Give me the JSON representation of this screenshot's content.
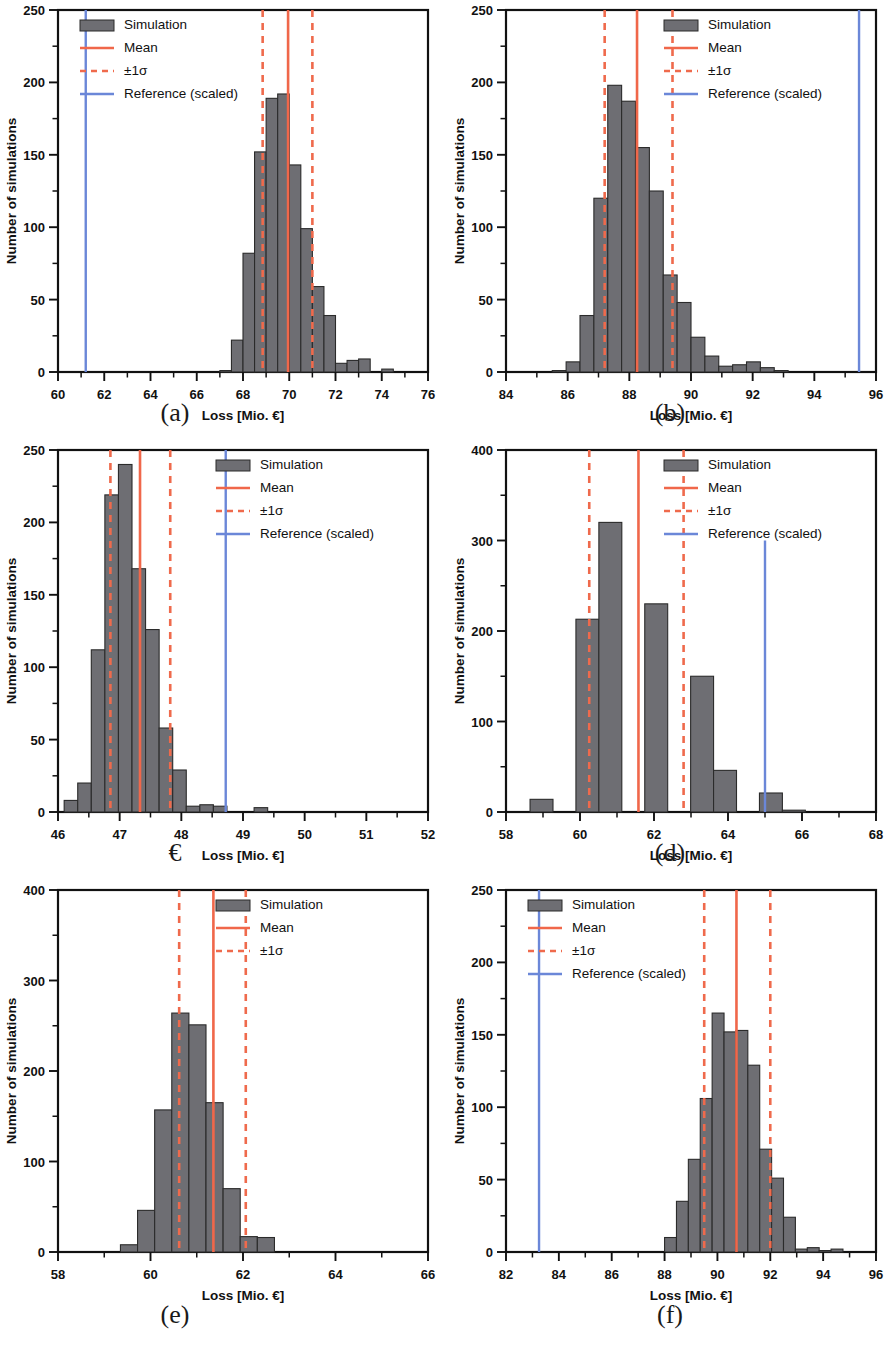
{
  "figure": {
    "axis_label_x": "Loss [Mio. €]",
    "axis_label_y": "Number of simulations",
    "legend": {
      "simulation": "Simulation",
      "mean": "Mean",
      "sigma": "±1σ",
      "reference": "Reference (scaled)"
    },
    "colors": {
      "bar_fill": "#6e6e73",
      "bar_edge": "#2b2b2b",
      "mean": "#f0674a",
      "sigma": "#ef6a4c",
      "reference": "#6b87d8",
      "axis": "#111111"
    },
    "captions": [
      "(a)",
      "(b)",
      "€",
      "(d)",
      "(e)",
      "(f)"
    ]
  },
  "chart_data": [
    {
      "type": "bar",
      "panel": "a",
      "title": "",
      "xlabel": "Loss [Mio. €]",
      "ylabel": "Number of simulations",
      "xlim": [
        60,
        76
      ],
      "ylim": [
        0,
        250
      ],
      "xticks": [
        60,
        62,
        64,
        66,
        68,
        70,
        72,
        74,
        76
      ],
      "yticks": [
        0,
        50,
        100,
        150,
        200,
        250
      ],
      "bin_width": 0.5,
      "bin_edges": [
        67.0,
        67.5,
        68.0,
        68.5,
        69.0,
        69.5,
        70.0,
        70.5,
        71.0,
        71.5,
        72.0,
        72.5,
        73.0,
        73.5,
        74.0,
        74.5,
        75.0
      ],
      "values": [
        1,
        22,
        82,
        152,
        189,
        192,
        143,
        99,
        59,
        39,
        6,
        8,
        9,
        0,
        2,
        0
      ],
      "mean": 69.95,
      "sigma_low": 68.85,
      "sigma_high": 71.0,
      "reference": 61.2,
      "legend_entries": [
        "Simulation",
        "Mean",
        "±1σ",
        "Reference (scaled)"
      ],
      "legend_position": "upper left",
      "grid": false
    },
    {
      "type": "bar",
      "panel": "b",
      "title": "",
      "xlabel": "Loss [Mio. €]",
      "ylabel": "Number of simulations",
      "xlim": [
        84,
        96
      ],
      "ylim": [
        0,
        250
      ],
      "xticks": [
        84,
        86,
        88,
        90,
        92,
        94,
        96
      ],
      "yticks": [
        0,
        50,
        100,
        150,
        200,
        250
      ],
      "bin_width": 0.45,
      "bin_edges": [
        85.5,
        85.95,
        86.4,
        86.85,
        87.3,
        87.75,
        88.2,
        88.65,
        89.1,
        89.55,
        90.0,
        90.45,
        90.9,
        91.35,
        91.8,
        92.25,
        92.7,
        93.15
      ],
      "values": [
        1,
        7,
        39,
        120,
        198,
        187,
        155,
        125,
        67,
        48,
        24,
        11,
        4,
        5,
        7,
        3,
        1
      ],
      "mean": 88.25,
      "sigma_low": 87.2,
      "sigma_high": 89.4,
      "reference": 95.45,
      "legend_entries": [
        "Simulation",
        "Mean",
        "±1σ",
        "Reference (scaled)"
      ],
      "legend_position": "upper right",
      "grid": false
    },
    {
      "type": "bar",
      "panel": "c",
      "title": "",
      "xlabel": "Loss [Mio. €]",
      "ylabel": "Number of simulations",
      "xlim": [
        46,
        52
      ],
      "ylim": [
        0,
        250
      ],
      "xticks": [
        46,
        47,
        48,
        49,
        50,
        51,
        52
      ],
      "yticks": [
        0,
        50,
        100,
        150,
        200,
        250
      ],
      "bin_width": 0.22,
      "bin_edges": [
        46.1,
        46.32,
        46.54,
        46.76,
        46.98,
        47.2,
        47.42,
        47.64,
        47.86,
        48.08,
        48.3,
        48.52,
        48.74,
        48.96,
        49.18,
        49.4,
        49.62,
        49.84
      ],
      "values": [
        8,
        20,
        112,
        219,
        240,
        168,
        126,
        58,
        29,
        4,
        5,
        4,
        0,
        0,
        3,
        0,
        0
      ],
      "mean": 47.33,
      "sigma_low": 46.85,
      "sigma_high": 47.82,
      "reference": 48.72,
      "legend_entries": [
        "Simulation",
        "Mean",
        "±1σ",
        "Reference (scaled)"
      ],
      "legend_position": "upper right",
      "grid": false
    },
    {
      "type": "bar",
      "panel": "d",
      "title": "",
      "xlabel": "Loss [Mio. €]",
      "ylabel": "Number of simulations",
      "xlim": [
        58,
        68
      ],
      "ylim": [
        0,
        400
      ],
      "xticks": [
        58,
        60,
        62,
        64,
        66,
        68
      ],
      "yticks": [
        0,
        100,
        200,
        300,
        400
      ],
      "bin_width": 0.62,
      "bin_edges": [
        58.65,
        59.27,
        59.89,
        60.51,
        61.13,
        61.75,
        62.37,
        62.99,
        63.61,
        64.23,
        64.85,
        65.47,
        66.09
      ],
      "values": [
        14,
        0,
        213,
        320,
        0,
        230,
        0,
        150,
        46,
        0,
        21,
        2
      ],
      "mean": 61.58,
      "sigma_low": 60.25,
      "sigma_high": 62.8,
      "reference": 65.0,
      "legend_entries": [
        "Simulation",
        "Mean",
        "±1σ",
        "Reference (scaled)"
      ],
      "legend_position": "upper right",
      "grid": false
    },
    {
      "type": "bar",
      "panel": "e",
      "title": "",
      "xlabel": "Loss [Mio. €]",
      "ylabel": "Number of simulations",
      "xlim": [
        58,
        66
      ],
      "ylim": [
        0,
        400
      ],
      "xticks": [
        58,
        60,
        62,
        64,
        66
      ],
      "yticks": [
        0,
        100,
        200,
        300,
        400
      ],
      "bin_width": 0.37,
      "bin_edges": [
        59.35,
        59.72,
        60.09,
        60.46,
        60.83,
        61.2,
        61.57,
        61.94,
        62.31,
        62.68,
        63.05,
        63.42,
        63.79
      ],
      "values": [
        8,
        46,
        157,
        264,
        251,
        165,
        70,
        17,
        16,
        0,
        0,
        0
      ],
      "mean": 61.36,
      "sigma_low": 60.62,
      "sigma_high": 62.06,
      "reference": null,
      "legend_entries": [
        "Simulation",
        "Mean",
        "±1σ"
      ],
      "legend_position": "upper right",
      "grid": false
    },
    {
      "type": "bar",
      "panel": "f",
      "title": "",
      "xlabel": "Loss [Mio. €]",
      "ylabel": "Number of simulations",
      "xlim": [
        82,
        96
      ],
      "ylim": [
        0,
        250
      ],
      "xticks": [
        82,
        84,
        86,
        88,
        90,
        92,
        94,
        96
      ],
      "yticks": [
        0,
        50,
        100,
        150,
        200,
        250
      ],
      "bin_width": 0.45,
      "bin_edges": [
        88.0,
        88.45,
        88.9,
        89.35,
        89.8,
        90.25,
        90.7,
        91.15,
        91.6,
        92.05,
        92.5,
        92.95,
        93.4,
        93.85,
        94.3,
        94.75,
        95.2
      ],
      "values": [
        10,
        35,
        64,
        106,
        165,
        152,
        153,
        129,
        71,
        51,
        24,
        2,
        3,
        1,
        2,
        0
      ],
      "mean": 90.72,
      "sigma_low": 89.5,
      "sigma_high": 92.0,
      "reference": 83.25,
      "legend_entries": [
        "Simulation",
        "Mean",
        "±1σ",
        "Reference (scaled)"
      ],
      "legend_position": "upper left",
      "grid": false
    }
  ]
}
